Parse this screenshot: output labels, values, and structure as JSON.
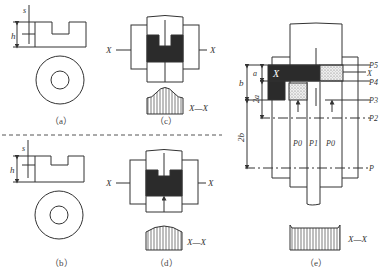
{
  "figure": {
    "panels": {
      "a": {
        "caption": "（a）",
        "dim_s": "s",
        "dim_h": "h"
      },
      "b": {
        "caption": "（b）",
        "dim_s": "s",
        "dim_h": "h"
      },
      "c": {
        "caption": "（c）",
        "section_left": "X",
        "section_right": "X",
        "section_label": "X—X"
      },
      "d": {
        "caption": "（d）",
        "section_left": "X",
        "section_right": "X",
        "section_label": "X—X"
      },
      "e": {
        "caption": "（e）",
        "block_label": "X",
        "dim_a": "a",
        "dim_2a": "2a",
        "dim_b": "b",
        "dim_2b": "2b",
        "right_labels": [
          "P5",
          "X",
          "P4",
          "P3",
          "P2",
          "P"
        ],
        "pressure_labels": [
          "P0",
          "P1",
          "P0"
        ],
        "section_label": "X—X"
      }
    },
    "colors": {
      "line": "#333333",
      "dark_fill": "#2b2b2b",
      "dotted_fill": "#d8d8d8",
      "dashed_divider": "#555555"
    }
  }
}
